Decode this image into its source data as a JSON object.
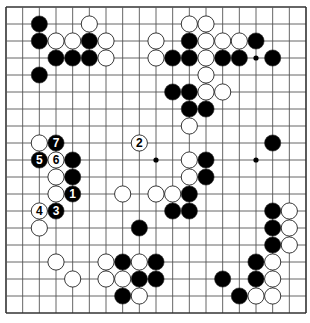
{
  "diagram": {
    "type": "go-board",
    "size": 19,
    "colors": {
      "background": "#ffffff",
      "line": "#555555",
      "border": "#333333",
      "black_stone": "#000000",
      "white_stone": "#ffffff",
      "stone_outline": "#222222"
    },
    "star_points_visible": [
      [
        15,
        3
      ],
      [
        9,
        9
      ],
      [
        15,
        9
      ]
    ],
    "black_stones": [
      [
        2,
        1
      ],
      [
        2,
        2
      ],
      [
        5,
        2
      ],
      [
        3,
        3
      ],
      [
        4,
        3
      ],
      [
        5,
        3
      ],
      [
        2,
        4
      ],
      [
        11,
        2
      ],
      [
        15,
        2
      ],
      [
        10,
        3
      ],
      [
        11,
        3
      ],
      [
        13,
        3
      ],
      [
        14,
        3
      ],
      [
        16,
        3
      ],
      [
        10,
        5
      ],
      [
        11,
        5
      ],
      [
        11,
        6
      ],
      [
        12,
        6
      ],
      [
        12,
        9
      ],
      [
        12,
        10
      ],
      [
        11,
        11
      ],
      [
        10,
        12
      ],
      [
        11,
        12
      ],
      [
        16,
        8
      ],
      [
        16,
        12
      ],
      [
        16,
        13
      ],
      [
        16,
        14
      ],
      [
        15,
        15
      ],
      [
        15,
        16
      ],
      [
        13,
        16
      ],
      [
        14,
        17
      ],
      [
        8,
        13
      ],
      [
        7,
        15
      ],
      [
        9,
        15
      ],
      [
        8,
        16
      ],
      [
        9,
        16
      ],
      [
        7,
        17
      ],
      [
        4,
        9
      ],
      [
        4,
        10
      ]
    ],
    "white_stones": [
      [
        5,
        1
      ],
      [
        3,
        2
      ],
      [
        4,
        2
      ],
      [
        6,
        2
      ],
      [
        6,
        3
      ],
      [
        11,
        1
      ],
      [
        12,
        1
      ],
      [
        9,
        2
      ],
      [
        12,
        2
      ],
      [
        13,
        2
      ],
      [
        14,
        2
      ],
      [
        9,
        3
      ],
      [
        12,
        3
      ],
      [
        12,
        4
      ],
      [
        12,
        5
      ],
      [
        13,
        5
      ],
      [
        11,
        7
      ],
      [
        11,
        9
      ],
      [
        11,
        10
      ],
      [
        7,
        11
      ],
      [
        9,
        11
      ],
      [
        10,
        11
      ],
      [
        2,
        8
      ],
      [
        3,
        10
      ],
      [
        3,
        11
      ],
      [
        2,
        13
      ],
      [
        17,
        12
      ],
      [
        17,
        13
      ],
      [
        17,
        14
      ],
      [
        16,
        15
      ],
      [
        16,
        16
      ],
      [
        15,
        17
      ],
      [
        16,
        17
      ],
      [
        3,
        15
      ],
      [
        4,
        16
      ],
      [
        6,
        15
      ],
      [
        6,
        16
      ],
      [
        7,
        16
      ],
      [
        8,
        15
      ],
      [
        8,
        17
      ]
    ],
    "numbered_moves": [
      {
        "n": "1",
        "color": "black",
        "pos": [
          4,
          11
        ]
      },
      {
        "n": "2",
        "color": "white",
        "pos": [
          8,
          8
        ]
      },
      {
        "n": "3",
        "color": "black",
        "pos": [
          3,
          12
        ]
      },
      {
        "n": "4",
        "color": "white",
        "pos": [
          2,
          12
        ]
      },
      {
        "n": "5",
        "color": "black",
        "pos": [
          2,
          9
        ]
      },
      {
        "n": "6",
        "color": "white",
        "pos": [
          3,
          9
        ]
      },
      {
        "n": "7",
        "color": "black",
        "pos": [
          3,
          8
        ]
      }
    ]
  }
}
